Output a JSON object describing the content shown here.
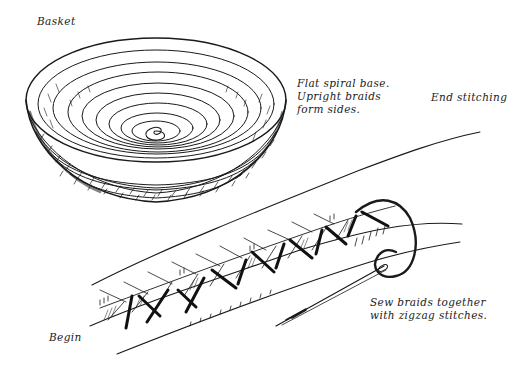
{
  "illustration": {
    "labels": {
      "basket": "Basket",
      "base_note": [
        "Flat spiral base.",
        "Upright braids",
        "form sides."
      ],
      "end_stitching": "End stitching",
      "sew_note": [
        "Sew braids together",
        "with zigzag stitches."
      ],
      "begin": "Begin"
    },
    "colors": {
      "ink": "#1a1a1a",
      "background": "#ffffff"
    },
    "parts": [
      "basket-bowl",
      "spiral-base",
      "braid-strip",
      "zigzag-stitches",
      "thread",
      "needle"
    ]
  }
}
